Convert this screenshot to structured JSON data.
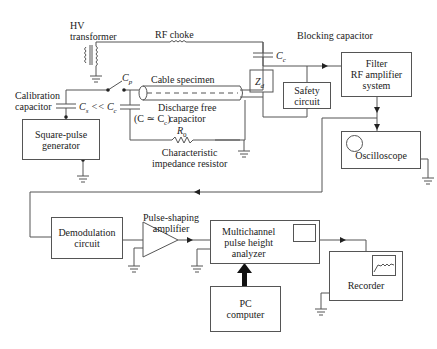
{
  "diagram": {
    "labels": {
      "hv_transformer": "HV\ntransformer",
      "rf_choke": "RF choke",
      "blocking_capacitor": "Blocking capacitor",
      "cc": "C",
      "cc_sub": "c",
      "cp": "C",
      "cp_sub": "p",
      "cable_specimen": "Cable specimen",
      "calibration_capacitor": "Calibration\ncapacitor",
      "cs_relation": "C",
      "cs_sub": "s",
      "cs_rel_text": " << C",
      "cs_rel_sub": "c",
      "discharge_free_capacitor": "Discharge free\ncapacitor",
      "c_approx": "(C ≃ C",
      "c_approx_sub": "c",
      "c_approx_end": ")",
      "r0": "R",
      "r0_sub": "0",
      "characteristic_impedance_resistor": "Characteristic\nimpedance resistor",
      "zd": "Z",
      "zd_sub": "d",
      "pulse_shaping_amplifier": "Pulse-shaping\namplifier"
    },
    "blocks": {
      "square_pulse_generator": "Square-pulse\ngenerator",
      "safety_circuit": "Safety\ncircuit",
      "filter_rf_amplifier": "Filter\nRF amplifier\nsystem",
      "oscilloscope": "Oscilloscope",
      "demodulation_circuit": "Demodulation\ncircuit",
      "multichannel_analyzer": "Multichannel\npulse height\nanalyzer",
      "pc_computer": "PC\ncomputer",
      "recorder": "Recorder"
    },
    "colors": {
      "line": "#555555",
      "text": "#222222",
      "background": "#ffffff"
    }
  }
}
